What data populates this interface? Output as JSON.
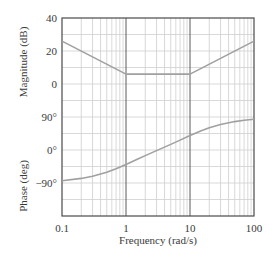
{
  "chart_data": [
    {
      "type": "line",
      "title": "",
      "xlabel": "Frequency (rad/s)",
      "ylabel": "Magnitude (dB)",
      "xscale": "log",
      "xlim": [
        0.1,
        100
      ],
      "ylim": [
        -20,
        40
      ],
      "x_ticks": [
        0.1,
        1,
        10,
        100
      ],
      "x_tick_labels": [
        "0.1",
        "1",
        "10",
        "100"
      ],
      "y_ticks": [
        0,
        20,
        40
      ],
      "y_tick_labels": [
        "0",
        "20",
        "40"
      ],
      "grid": true,
      "series": [
        {
          "name": "Magnitude asymptote",
          "x": [
            0.1,
            1,
            10,
            100
          ],
          "values": [
            26,
            6,
            6,
            26
          ]
        }
      ]
    },
    {
      "type": "line",
      "title": "",
      "xlabel": "Frequency (rad/s)",
      "ylabel": "Phase (deg)",
      "xscale": "log",
      "xlim": [
        0.1,
        100
      ],
      "ylim": [
        -180,
        90
      ],
      "x_ticks": [
        0.1,
        1,
        10,
        100
      ],
      "x_tick_labels": [
        "0.1",
        "1",
        "10",
        "100"
      ],
      "y_ticks": [
        -90,
        0,
        90
      ],
      "y_tick_labels": [
        "−90°",
        "0°",
        "90°"
      ],
      "grid": true,
      "series": [
        {
          "name": "Phase",
          "x": [
            0.1,
            0.2,
            0.3,
            0.5,
            0.7,
            1,
            1.5,
            2,
            3,
            5,
            7,
            10,
            15,
            20,
            30,
            50,
            70,
            100
          ],
          "values": [
            -83.7,
            -77.5,
            -71.6,
            -60.6,
            -51.0,
            -39.3,
            -25.2,
            -15.3,
            -1.7,
            15.3,
            26.9,
            39.3,
            52.5,
            60.6,
            69.7,
            77.5,
            81.1,
            83.7
          ]
        }
      ]
    }
  ],
  "labels": {
    "magnitude_ylabel": "Magnitude (dB)",
    "phase_ylabel": "Phase (deg)",
    "xlabel": "Frequency (rad/s)"
  }
}
